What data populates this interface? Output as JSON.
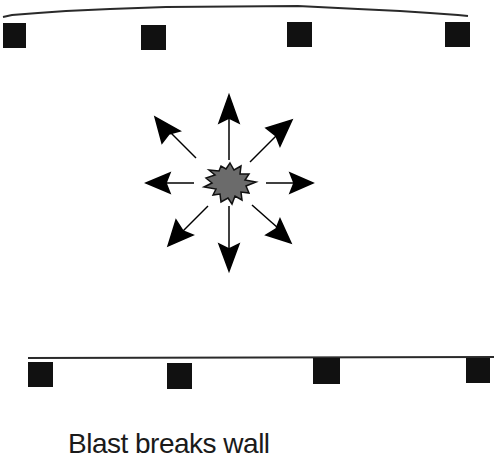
{
  "diagram": {
    "caption": "Blast breaks wall",
    "colors": {
      "line": "#1a1a1a",
      "block": "#111111",
      "explosion": "#6b6b6b",
      "arrow": "#000000"
    },
    "top_wall": {
      "shape": "arc",
      "blocks": 4
    },
    "bottom_wall": {
      "shape": "straight",
      "blocks": 4
    },
    "blast": {
      "arrows": 8,
      "directions": [
        "up",
        "up-right",
        "right",
        "down-right",
        "down",
        "down-left",
        "left",
        "up-left"
      ]
    }
  }
}
